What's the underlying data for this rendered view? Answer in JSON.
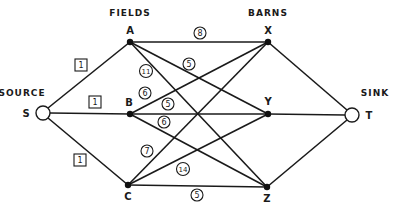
{
  "groups": {
    "source": "SOURCE",
    "fields": "FIELDS",
    "barns": "BARNS",
    "sink": "SINK"
  },
  "nodes": {
    "S": {
      "label": "S",
      "x": 43,
      "y": 113,
      "type": "terminal"
    },
    "A": {
      "label": "A",
      "x": 130,
      "y": 42,
      "type": "field"
    },
    "B": {
      "label": "B",
      "x": 130,
      "y": 114,
      "type": "field"
    },
    "C": {
      "label": "C",
      "x": 128,
      "y": 185,
      "type": "field"
    },
    "X": {
      "label": "X",
      "x": 268,
      "y": 42,
      "type": "barn"
    },
    "Y": {
      "label": "Y",
      "x": 268,
      "y": 114,
      "type": "barn"
    },
    "Z": {
      "label": "Z",
      "x": 267,
      "y": 187,
      "type": "barn"
    },
    "T": {
      "label": "T",
      "x": 352,
      "y": 115,
      "type": "terminal"
    }
  },
  "edges": [
    {
      "from": "S",
      "to": "A",
      "capacity": "1",
      "style": "box",
      "lx": 81,
      "ly": 65
    },
    {
      "from": "S",
      "to": "B",
      "capacity": "1",
      "style": "box",
      "lx": 95,
      "ly": 102
    },
    {
      "from": "S",
      "to": "C",
      "capacity": "1",
      "style": "box",
      "lx": 80,
      "ly": 160
    },
    {
      "from": "A",
      "to": "X",
      "capacity": "8",
      "style": "circle",
      "lx": 200,
      "ly": 33
    },
    {
      "from": "A",
      "to": "Y",
      "capacity": "5",
      "style": "circle",
      "lx": 189,
      "ly": 64
    },
    {
      "from": "A",
      "to": "Z",
      "capacity": "11",
      "style": "circle",
      "lx": 146,
      "ly": 71
    },
    {
      "from": "B",
      "to": "X",
      "capacity": "6",
      "style": "circle",
      "lx": 145,
      "ly": 93
    },
    {
      "from": "B",
      "to": "Y",
      "capacity": "5",
      "style": "circle",
      "lx": 168,
      "ly": 104
    },
    {
      "from": "B",
      "to": "Z",
      "capacity": "6",
      "style": "circle",
      "lx": 164,
      "ly": 122
    },
    {
      "from": "C",
      "to": "X",
      "capacity": "7",
      "style": "circle",
      "lx": 147,
      "ly": 151
    },
    {
      "from": "C",
      "to": "Y",
      "capacity": "14",
      "style": "circle",
      "lx": 183,
      "ly": 169
    },
    {
      "from": "C",
      "to": "Z",
      "capacity": "5",
      "style": "circle",
      "lx": 197,
      "ly": 195
    },
    {
      "from": "X",
      "to": "T",
      "capacity": "",
      "style": "none"
    },
    {
      "from": "Y",
      "to": "T",
      "capacity": "",
      "style": "none"
    },
    {
      "from": "Z",
      "to": "T",
      "capacity": "",
      "style": "none"
    }
  ],
  "labels": {
    "S": "S",
    "A": "A",
    "B": "B",
    "C": "C",
    "X": "X",
    "Y": "Y",
    "Z": "Z",
    "T": "T"
  },
  "caps": {
    "SA": "1",
    "SB": "1",
    "SC": "1",
    "AX": "8",
    "AY": "5",
    "AZ": "11",
    "BX": "6",
    "BY": "5",
    "BZ": "6",
    "CX": "7",
    "CY": "14",
    "CZ": "5"
  }
}
